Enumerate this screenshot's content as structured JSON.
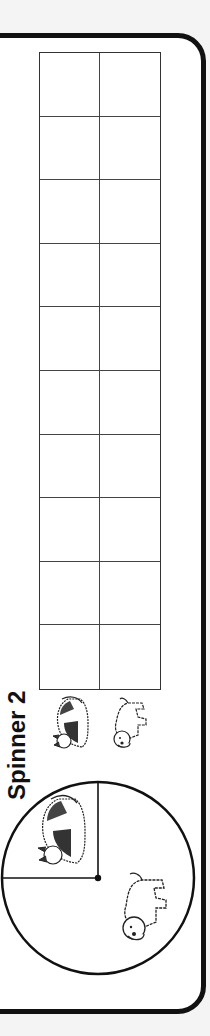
{
  "worksheet": {
    "title": "Spinner 2",
    "spinner": {
      "sections": [
        {
          "label": "cat",
          "fraction": "1/4",
          "icon": "cat-icon"
        },
        {
          "label": "dog",
          "fraction": "3/4",
          "icon": "dog-icon"
        }
      ]
    },
    "tally_table": {
      "columns": [
        {
          "header_icon": "cat-icon",
          "label": "cat"
        },
        {
          "header_icon": "dog-icon",
          "label": "dog"
        }
      ],
      "rows": 10,
      "cells": [
        [
          "",
          ""
        ],
        [
          "",
          ""
        ],
        [
          "",
          ""
        ],
        [
          "",
          ""
        ],
        [
          "",
          ""
        ],
        [
          "",
          ""
        ],
        [
          "",
          ""
        ],
        [
          "",
          ""
        ],
        [
          "",
          ""
        ],
        [
          "",
          ""
        ]
      ]
    },
    "colors": {
      "frame": "#111111",
      "background": "#ffffff",
      "gridlines": "#444444"
    }
  }
}
